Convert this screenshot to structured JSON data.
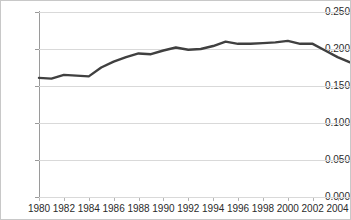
{
  "chart_data": {
    "type": "line",
    "title": "",
    "subtitle": "",
    "xlabel": "",
    "ylabel": "",
    "x": [
      1980,
      1981,
      1982,
      1983,
      1984,
      1985,
      1986,
      1987,
      1988,
      1989,
      1990,
      1991,
      1992,
      1993,
      1994,
      1995,
      1996,
      1997,
      1998,
      1999,
      2000,
      2001,
      2002,
      2003,
      2004,
      2005
    ],
    "values": [
      0.161,
      0.16,
      0.165,
      0.164,
      0.163,
      0.175,
      0.183,
      0.189,
      0.194,
      0.193,
      0.198,
      0.202,
      0.199,
      0.2,
      0.204,
      0.21,
      0.207,
      0.207,
      0.208,
      0.209,
      0.211,
      0.207,
      0.207,
      0.198,
      0.189,
      0.182
    ],
    "xlim": [
      1980,
      2005
    ],
    "ylim": [
      0.0,
      0.25
    ],
    "grid": true,
    "grid_axis": "y",
    "legend": false,
    "legend_position": "none",
    "line_color": "#404040",
    "line_width": 2.4,
    "grid_color": "#d9d9d9",
    "axis_color": "#9a9a9a",
    "background_color": "#ffffff",
    "y_ticks": [
      {
        "value": 0.0,
        "label": "0.000"
      },
      {
        "value": 0.05,
        "label": "0.050"
      },
      {
        "value": 0.1,
        "label": "0.100"
      },
      {
        "value": 0.15,
        "label": "0.150"
      },
      {
        "value": 0.2,
        "label": "0.200"
      },
      {
        "value": 0.25,
        "label": "0.250"
      }
    ],
    "x_ticks": [
      {
        "value": 1980,
        "label": "1980"
      },
      {
        "value": 1982,
        "label": "1982"
      },
      {
        "value": 1984,
        "label": "1984"
      },
      {
        "value": 1986,
        "label": "1986"
      },
      {
        "value": 1988,
        "label": "1988"
      },
      {
        "value": 1990,
        "label": "1990"
      },
      {
        "value": 1992,
        "label": "1992"
      },
      {
        "value": 1994,
        "label": "1994"
      },
      {
        "value": 1996,
        "label": "1996"
      },
      {
        "value": 1998,
        "label": "1998"
      },
      {
        "value": 2000,
        "label": "2000"
      },
      {
        "value": 2002,
        "label": "2002"
      },
      {
        "value": 2004,
        "label": "2004"
      }
    ]
  }
}
